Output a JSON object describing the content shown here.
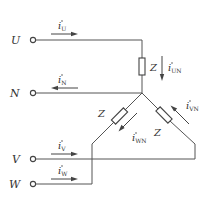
{
  "diagram": {
    "type": "three-phase star (Y) load circuit with neutral",
    "terminals": [
      {
        "id": "U",
        "label": "U"
      },
      {
        "id": "N",
        "label": "N"
      },
      {
        "id": "V",
        "label": "V"
      },
      {
        "id": "W",
        "label": "W"
      }
    ],
    "line_currents": [
      {
        "id": "iU",
        "symbol": "i",
        "subscript": "U",
        "direction": "right"
      },
      {
        "id": "iN",
        "symbol": "i",
        "subscript": "N",
        "direction": "left"
      },
      {
        "id": "iV",
        "symbol": "i",
        "subscript": "V",
        "direction": "right"
      },
      {
        "id": "iW",
        "symbol": "i",
        "subscript": "W",
        "direction": "right"
      }
    ],
    "branch_currents": [
      {
        "id": "iUN",
        "symbol": "i",
        "subscript": "UN",
        "direction": "down"
      },
      {
        "id": "iWN",
        "symbol": "i",
        "subscript": "WN",
        "direction": "down-left"
      },
      {
        "id": "iVN",
        "symbol": "i",
        "subscript": "VN",
        "direction": "up-left"
      }
    ],
    "impedances": [
      {
        "id": "Z_U",
        "label": "Z"
      },
      {
        "id": "Z_W",
        "label": "Z"
      },
      {
        "id": "Z_V",
        "label": "Z"
      }
    ]
  }
}
